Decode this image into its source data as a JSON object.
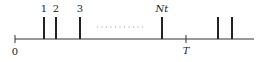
{
  "diagram": {
    "type": "timeline",
    "axis": {
      "start_label": "0",
      "end_marker_label": "T"
    },
    "events": [
      {
        "label": "1",
        "x": 44
      },
      {
        "label": "2",
        "x": 56
      },
      {
        "label": "3",
        "x": 80
      },
      {
        "label": "Nt",
        "x": 162
      },
      {
        "label": "",
        "x": 218
      },
      {
        "label": "",
        "x": 232
      }
    ],
    "ellipsis": "............",
    "colors": {
      "line": "#222222",
      "dots": "#999999"
    }
  }
}
